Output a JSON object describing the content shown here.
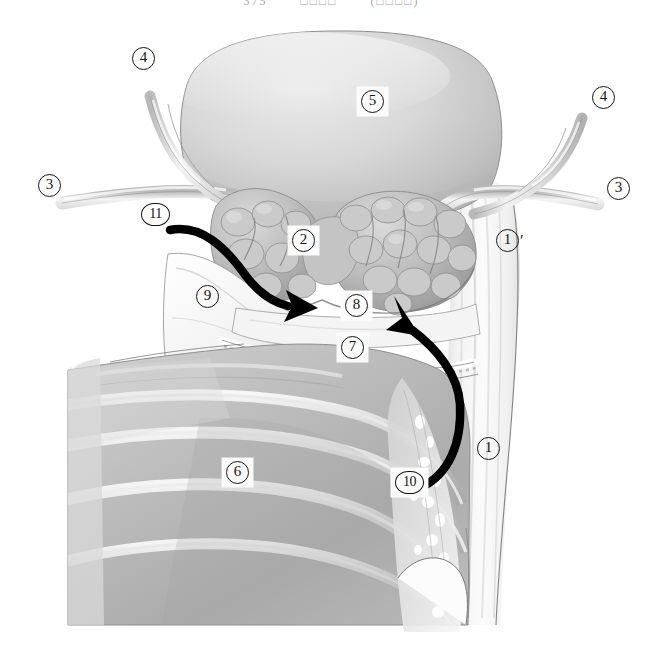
{
  "page": {
    "header_fragments": [
      "375",
      "□□□□",
      "(□□□□)"
    ],
    "background": "#ffffff",
    "figure_type": "anatomical-illustration",
    "figure_subject": "grayscale surgical anatomy drawing of bladder, seminal vesicles and surrounding fascia"
  },
  "figure": {
    "ink_color": "#151515",
    "tone_light": "#f1f1f1",
    "tone_mid": "#c9c9c9",
    "tone_dark": "#9a9a9a",
    "arrow_color": "#000000"
  },
  "callouts": [
    {
      "id": "c4-left",
      "number": "4",
      "prime": "",
      "boxed": false,
      "x": 132,
      "y": 47,
      "name": "callout-4-left"
    },
    {
      "id": "c5",
      "number": "5",
      "prime": "",
      "boxed": true,
      "x": 357,
      "y": 87,
      "name": "callout-5-bladder"
    },
    {
      "id": "c4-right",
      "number": "4",
      "prime": "",
      "boxed": false,
      "x": 592,
      "y": 86,
      "name": "callout-4-right"
    },
    {
      "id": "c3-left",
      "number": "3",
      "prime": "",
      "boxed": false,
      "x": 38,
      "y": 174,
      "name": "callout-3-left"
    },
    {
      "id": "c3-right",
      "number": "3",
      "prime": "",
      "boxed": false,
      "x": 607,
      "y": 177,
      "name": "callout-3-right"
    },
    {
      "id": "c11",
      "number": "11",
      "prime": "",
      "boxed": false,
      "x": 141,
      "y": 203,
      "name": "callout-11-arrow-origin"
    },
    {
      "id": "c2",
      "number": "2",
      "prime": "",
      "boxed": true,
      "x": 288,
      "y": 226,
      "name": "callout-2-seminal-vesicle"
    },
    {
      "id": "c1prime",
      "number": "1",
      "prime": "′",
      "boxed": false,
      "x": 496,
      "y": 229,
      "name": "callout-1-prime"
    },
    {
      "id": "c9",
      "number": "9",
      "prime": "",
      "boxed": false,
      "x": 196,
      "y": 285,
      "name": "callout-9-fascia"
    },
    {
      "id": "c8",
      "number": "8",
      "prime": "",
      "boxed": true,
      "x": 341,
      "y": 291,
      "name": "callout-8-layer"
    },
    {
      "id": "c7",
      "number": "7",
      "prime": "",
      "boxed": true,
      "x": 337,
      "y": 333,
      "name": "callout-7-layer"
    },
    {
      "id": "c1",
      "number": "1",
      "prime": "",
      "boxed": false,
      "x": 477,
      "y": 437,
      "name": "callout-1-rectum-wall"
    },
    {
      "id": "c6",
      "number": "6",
      "prime": "",
      "boxed": true,
      "x": 222,
      "y": 458,
      "name": "callout-6-muscle"
    },
    {
      "id": "c10",
      "number": "10",
      "prime": "",
      "boxed": true,
      "x": 391,
      "y": 468,
      "name": "callout-10-arrow-origin"
    }
  ],
  "arrows": [
    {
      "id": "arrow-11",
      "name": "dissection-arrow-upper-left",
      "description": "thick black curved arrow sweeping from label 11 rightward and down to the seminal vesicle base"
    },
    {
      "id": "arrow-10",
      "name": "dissection-arrow-lower-right",
      "description": "thick black curved arrow rising from label 10 upward to the right side of the seminal vesicle"
    }
  ]
}
